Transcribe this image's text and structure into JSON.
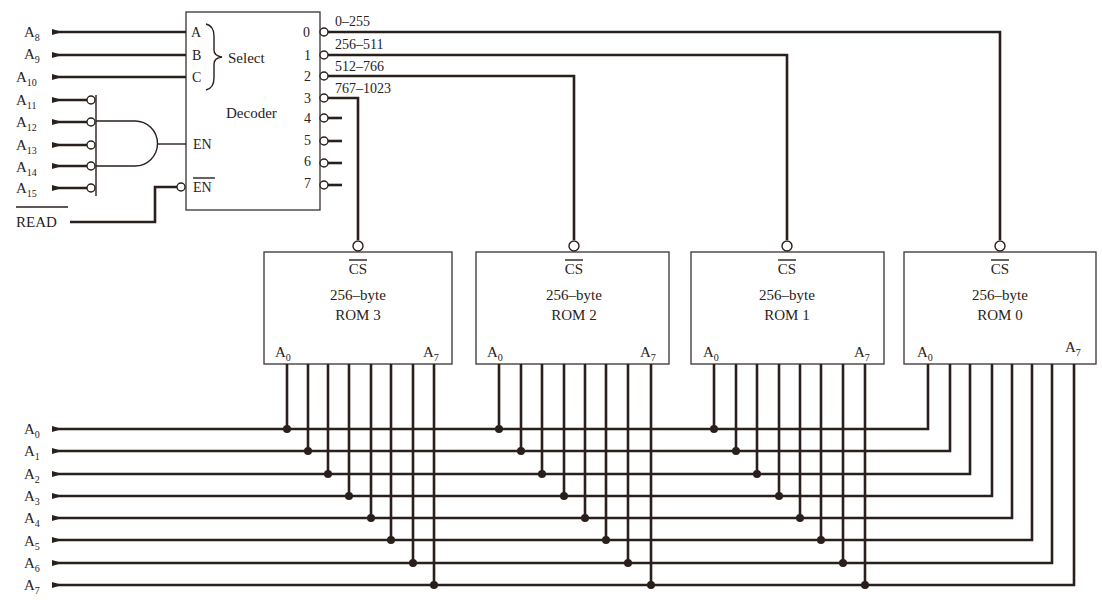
{
  "decoder": {
    "title": "Decoder",
    "select_label": "Select",
    "inputs": [
      {
        "pin": "A",
        "signal": "A",
        "sub": "8"
      },
      {
        "pin": "B",
        "signal": "A",
        "sub": "9"
      },
      {
        "pin": "C",
        "signal": "A",
        "sub": "10"
      }
    ],
    "enable_label": "EN",
    "enable_bar_label": "EN",
    "outputs": [
      "0",
      "1",
      "2",
      "3",
      "4",
      "5",
      "6",
      "7"
    ],
    "ranges": [
      "0–255",
      "256–511",
      "512–766",
      "767–1023"
    ]
  },
  "gate_inputs": [
    {
      "signal": "A",
      "sub": "11"
    },
    {
      "signal": "A",
      "sub": "12"
    },
    {
      "signal": "A",
      "sub": "13"
    },
    {
      "signal": "A",
      "sub": "14"
    },
    {
      "signal": "A",
      "sub": "15"
    }
  ],
  "read_label": "READ",
  "roms": [
    {
      "cs": "CS",
      "size": "256–byte",
      "name": "ROM 3",
      "a_low": "A",
      "a_low_sub": "0",
      "a_high": "A",
      "a_high_sub": "7"
    },
    {
      "cs": "CS",
      "size": "256–byte",
      "name": "ROM 2",
      "a_low": "A",
      "a_low_sub": "0",
      "a_high": "A",
      "a_high_sub": "7"
    },
    {
      "cs": "CS",
      "size": "256–byte",
      "name": "ROM 1",
      "a_low": "A",
      "a_low_sub": "0",
      "a_high": "A",
      "a_high_sub": "7"
    },
    {
      "cs": "CS",
      "size": "256–byte",
      "name": "ROM 0",
      "a_low": "A",
      "a_low_sub": "0",
      "a_high": "A",
      "a_high_sub": "7"
    }
  ],
  "address_bus": [
    {
      "signal": "A",
      "sub": "0"
    },
    {
      "signal": "A",
      "sub": "1"
    },
    {
      "signal": "A",
      "sub": "2"
    },
    {
      "signal": "A",
      "sub": "3"
    },
    {
      "signal": "A",
      "sub": "4"
    },
    {
      "signal": "A",
      "sub": "5"
    },
    {
      "signal": "A",
      "sub": "6"
    },
    {
      "signal": "A",
      "sub": "7"
    }
  ]
}
